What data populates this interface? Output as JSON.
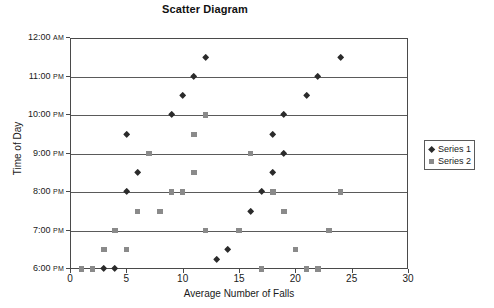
{
  "chart_data": {
    "type": "scatter",
    "title": "Scatter Diagram",
    "xlabel": "Average Number of Falls",
    "ylabel": "Time of Day",
    "xlim": [
      0,
      30
    ],
    "xticks": [
      0,
      5,
      10,
      15,
      20,
      25,
      30
    ],
    "ylim": [
      18,
      24
    ],
    "yticks": [
      18,
      19,
      20,
      21,
      22,
      23,
      24
    ],
    "ytick_labels": [
      {
        "time": "6:00",
        "suffix": "PM"
      },
      {
        "time": "7:00",
        "suffix": "PM"
      },
      {
        "time": "8:00",
        "suffix": "PM"
      },
      {
        "time": "9:00",
        "suffix": "PM"
      },
      {
        "time": "10:00",
        "suffix": "PM"
      },
      {
        "time": "11:00",
        "suffix": "PM"
      },
      {
        "time": "12:00",
        "suffix": "AM"
      }
    ],
    "grid": "horizontal",
    "legend_position": "right",
    "series": [
      {
        "name": "Series 1",
        "marker": "diamond",
        "color": "#2b2b2b",
        "points": [
          [
            3,
            18.0
          ],
          [
            4,
            18.0
          ],
          [
            13,
            18.25
          ],
          [
            14,
            18.5
          ],
          [
            16,
            19.5
          ],
          [
            5,
            20.0
          ],
          [
            17,
            20.0
          ],
          [
            6,
            20.5
          ],
          [
            18,
            20.5
          ],
          [
            19,
            21.0
          ],
          [
            5,
            21.5
          ],
          [
            18,
            21.5
          ],
          [
            9,
            22.0
          ],
          [
            19,
            22.0
          ],
          [
            10,
            22.5
          ],
          [
            21,
            22.5
          ],
          [
            11,
            23.0
          ],
          [
            22,
            23.0
          ],
          [
            12,
            23.5
          ],
          [
            24,
            23.5
          ]
        ]
      },
      {
        "name": "Series 2",
        "marker": "square",
        "color": "#8a8a8a",
        "points": [
          [
            1,
            18.0
          ],
          [
            2,
            18.0
          ],
          [
            17,
            18.0
          ],
          [
            21,
            18.0
          ],
          [
            22,
            18.0
          ],
          [
            3,
            18.5
          ],
          [
            5,
            18.5
          ],
          [
            20,
            18.5
          ],
          [
            4,
            19.0
          ],
          [
            12,
            19.0
          ],
          [
            15,
            19.0
          ],
          [
            23,
            19.0
          ],
          [
            6,
            19.5
          ],
          [
            8,
            19.5
          ],
          [
            19,
            19.5
          ],
          [
            9,
            20.0
          ],
          [
            10,
            20.0
          ],
          [
            18,
            20.0
          ],
          [
            24,
            20.0
          ],
          [
            11,
            20.5
          ],
          [
            7,
            21.0
          ],
          [
            16,
            21.0
          ],
          [
            11,
            21.5
          ],
          [
            12,
            22.0
          ]
        ]
      }
    ]
  },
  "legend": {
    "items": [
      {
        "label": "Series 1",
        "marker": "diamond-icon"
      },
      {
        "label": "Series 2",
        "marker": "square-icon"
      }
    ]
  }
}
